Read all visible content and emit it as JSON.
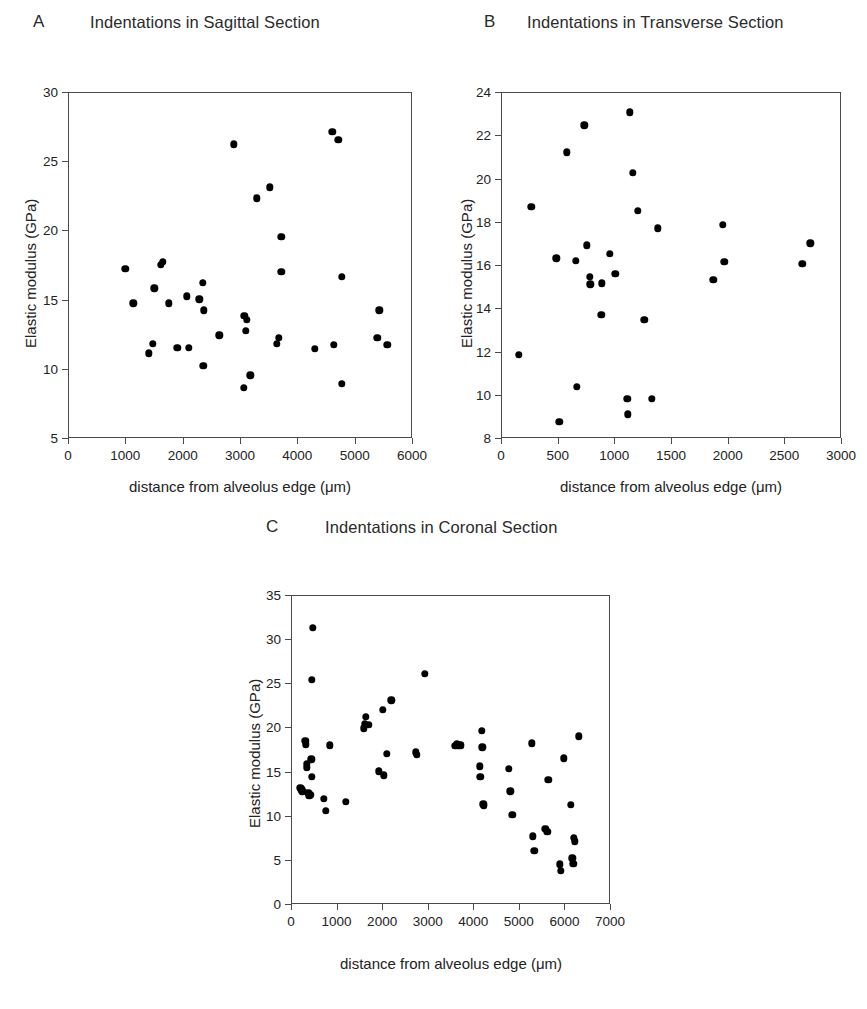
{
  "figure": {
    "background": "#ffffff",
    "marker_color": "#000000",
    "axis_color": "#4a4a4a"
  },
  "panels": [
    {
      "letter": "A",
      "title": "Indentations in Sagittal Section",
      "xlabel": "distance from alveolus edge (μm)",
      "ylabel": "Elastic modulus (GPa)",
      "xticks": [
        "0",
        "1000",
        "2000",
        "3000",
        "4000",
        "5000",
        "6000"
      ],
      "yticks": [
        "5",
        "10",
        "15",
        "20",
        "25",
        "30"
      ]
    },
    {
      "letter": "B",
      "title": "Indentations in Transverse Section",
      "xlabel": "distance from alveolus edge (μm)",
      "ylabel": "Elastic modulus (GPa)",
      "xticks": [
        "0",
        "500",
        "1000",
        "1500",
        "2000",
        "2500",
        "3000"
      ],
      "yticks": [
        "8",
        "10",
        "12",
        "14",
        "16",
        "18",
        "20",
        "22",
        "24"
      ]
    },
    {
      "letter": "C",
      "title": "Indentations in Coronal Section",
      "xlabel": "distance from alveolus edge (μm)",
      "ylabel": "Elastic modulus (GPa)",
      "xticks": [
        "0",
        "1000",
        "2000",
        "3000",
        "4000",
        "5000",
        "6000",
        "7000"
      ],
      "yticks": [
        "0",
        "5",
        "10",
        "15",
        "20",
        "25",
        "30",
        "35"
      ]
    }
  ],
  "chart_data": [
    {
      "type": "scatter",
      "panel": "A",
      "title": "Indentations in Sagittal Section",
      "xlabel": "distance from alveolus edge (μm)",
      "ylabel": "Elastic modulus (GPa)",
      "xlim": [
        0,
        6000
      ],
      "ylim": [
        5,
        30
      ],
      "xticks": [
        0,
        1000,
        2000,
        3000,
        4000,
        5000,
        6000
      ],
      "yticks": [
        5,
        10,
        15,
        20,
        25,
        30
      ],
      "grid": false,
      "legend": "none",
      "points": [
        [
          980,
          17.3
        ],
        [
          1120,
          14.8
        ],
        [
          1390,
          11.2
        ],
        [
          1460,
          11.9
        ],
        [
          1490,
          15.9
        ],
        [
          1600,
          17.6
        ],
        [
          1640,
          17.8
        ],
        [
          1740,
          14.8
        ],
        [
          1890,
          11.6
        ],
        [
          2060,
          15.3
        ],
        [
          2090,
          11.6
        ],
        [
          2270,
          15.1
        ],
        [
          2330,
          16.3
        ],
        [
          2350,
          14.3
        ],
        [
          2340,
          10.3
        ],
        [
          2620,
          12.5
        ],
        [
          2870,
          26.3
        ],
        [
          3050,
          8.7
        ],
        [
          3060,
          13.9
        ],
        [
          3080,
          12.8
        ],
        [
          3100,
          13.6
        ],
        [
          3160,
          9.6
        ],
        [
          3280,
          22.4
        ],
        [
          3500,
          23.2
        ],
        [
          3620,
          11.9
        ],
        [
          3660,
          12.3
        ],
        [
          3700,
          19.6
        ],
        [
          3700,
          17.1
        ],
        [
          4290,
          11.5
        ],
        [
          4590,
          27.2
        ],
        [
          4620,
          11.8
        ],
        [
          4700,
          26.6
        ],
        [
          4760,
          16.7
        ],
        [
          4760,
          9.0
        ],
        [
          5380,
          12.3
        ],
        [
          5410,
          14.3
        ],
        [
          5550,
          11.8
        ]
      ]
    },
    {
      "type": "scatter",
      "panel": "B",
      "title": "Indentations in Transverse Section",
      "xlabel": "distance from alveolus edge (μm)",
      "ylabel": "Elastic modulus (GPa)",
      "xlim": [
        0,
        3000
      ],
      "ylim": [
        8,
        24
      ],
      "xticks": [
        0,
        500,
        1000,
        1500,
        2000,
        2500,
        3000
      ],
      "yticks": [
        8,
        10,
        12,
        14,
        16,
        18,
        20,
        22,
        24
      ],
      "grid": false,
      "legend": "none",
      "points": [
        [
          150,
          11.9
        ],
        [
          260,
          18.75
        ],
        [
          480,
          16.35
        ],
        [
          505,
          8.8
        ],
        [
          570,
          21.25
        ],
        [
          650,
          16.25
        ],
        [
          660,
          10.4
        ],
        [
          725,
          22.5
        ],
        [
          750,
          16.95
        ],
        [
          775,
          15.5
        ],
        [
          780,
          15.15
        ],
        [
          875,
          13.75
        ],
        [
          880,
          15.2
        ],
        [
          950,
          16.55
        ],
        [
          1000,
          15.65
        ],
        [
          1105,
          9.85
        ],
        [
          1110,
          9.15
        ],
        [
          1130,
          23.1
        ],
        [
          1155,
          20.3
        ],
        [
          1200,
          18.55
        ],
        [
          1255,
          13.5
        ],
        [
          1320,
          9.85
        ],
        [
          1375,
          17.75
        ],
        [
          1865,
          15.35
        ],
        [
          1950,
          17.9
        ],
        [
          1960,
          16.2
        ],
        [
          2650,
          16.1
        ],
        [
          2720,
          17.05
        ]
      ]
    },
    {
      "type": "scatter",
      "panel": "C",
      "title": "Indentations in Coronal Section",
      "xlabel": "distance from alveolus edge (μm)",
      "ylabel": "Elastic modulus (GPa)",
      "xlim": [
        0,
        7000
      ],
      "ylim": [
        0,
        35
      ],
      "xticks": [
        0,
        1000,
        2000,
        3000,
        4000,
        5000,
        6000,
        7000
      ],
      "yticks": [
        0,
        5,
        10,
        15,
        20,
        25,
        30,
        35
      ],
      "grid": false,
      "legend": "none",
      "points": [
        [
          180,
          13.3
        ],
        [
          200,
          13.1
        ],
        [
          230,
          12.9
        ],
        [
          290,
          18.6
        ],
        [
          300,
          18.2
        ],
        [
          320,
          15.6
        ],
        [
          330,
          16.0
        ],
        [
          360,
          12.7
        ],
        [
          380,
          12.4
        ],
        [
          400,
          12.5
        ],
        [
          420,
          16.5
        ],
        [
          430,
          14.5
        ],
        [
          440,
          25.5
        ],
        [
          450,
          31.4
        ],
        [
          700,
          12.0
        ],
        [
          740,
          10.7
        ],
        [
          830,
          18.1
        ],
        [
          1180,
          11.7
        ],
        [
          1580,
          20.0
        ],
        [
          1600,
          20.5
        ],
        [
          1620,
          21.3
        ],
        [
          1680,
          20.4
        ],
        [
          1900,
          15.15
        ],
        [
          1990,
          22.1
        ],
        [
          2020,
          14.7
        ],
        [
          2080,
          17.1
        ],
        [
          2180,
          23.2
        ],
        [
          2720,
          17.3
        ],
        [
          2740,
          17.0
        ],
        [
          2920,
          26.2
        ],
        [
          3580,
          18.0
        ],
        [
          3620,
          18.2
        ],
        [
          3650,
          18.1
        ],
        [
          3700,
          18.1
        ],
        [
          4120,
          15.7
        ],
        [
          4130,
          14.5
        ],
        [
          4170,
          19.75
        ],
        [
          4180,
          17.85
        ],
        [
          4200,
          11.4
        ],
        [
          4210,
          11.25
        ],
        [
          4760,
          15.4
        ],
        [
          4790,
          12.9
        ],
        [
          4830,
          10.2
        ],
        [
          5260,
          18.3
        ],
        [
          5280,
          7.8
        ],
        [
          5320,
          6.15
        ],
        [
          5560,
          8.6
        ],
        [
          5600,
          8.3
        ],
        [
          5620,
          14.2
        ],
        [
          5880,
          4.6
        ],
        [
          5900,
          3.85
        ],
        [
          5960,
          16.6
        ],
        [
          6120,
          11.35
        ],
        [
          6150,
          5.3
        ],
        [
          6170,
          4.7
        ],
        [
          6190,
          7.6
        ],
        [
          6210,
          7.2
        ],
        [
          6300,
          19.1
        ]
      ]
    }
  ]
}
